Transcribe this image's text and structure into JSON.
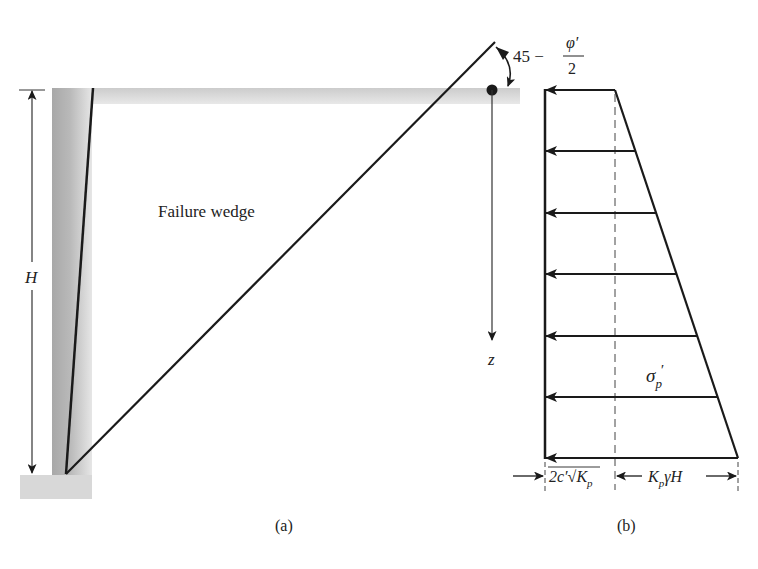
{
  "figure": {
    "panel_a": {
      "caption": "(a)",
      "wedge_label": "Failure wedge",
      "height_label": "H",
      "depth_label": "z",
      "angle_label": {
        "prefix": "45 −",
        "numerator": "φ′",
        "denominator": "2"
      }
    },
    "panel_b": {
      "caption": "(b)",
      "stress_label": {
        "symbol": "σ",
        "subscript": "p",
        "prime": "′"
      },
      "width_left_label": "2c′√K",
      "width_left_sub": "p",
      "width_right_label_pre": "K",
      "width_right_sub": "p",
      "width_right_label_post": "γH",
      "arrow_count": 7
    }
  },
  "colors": {
    "line": "#1a1a1a",
    "soil_band": "#d6d6d6",
    "wall_dark": "#9a9a9a",
    "wall_light": "#cfcfcf",
    "footing": "#d9d9d9"
  }
}
